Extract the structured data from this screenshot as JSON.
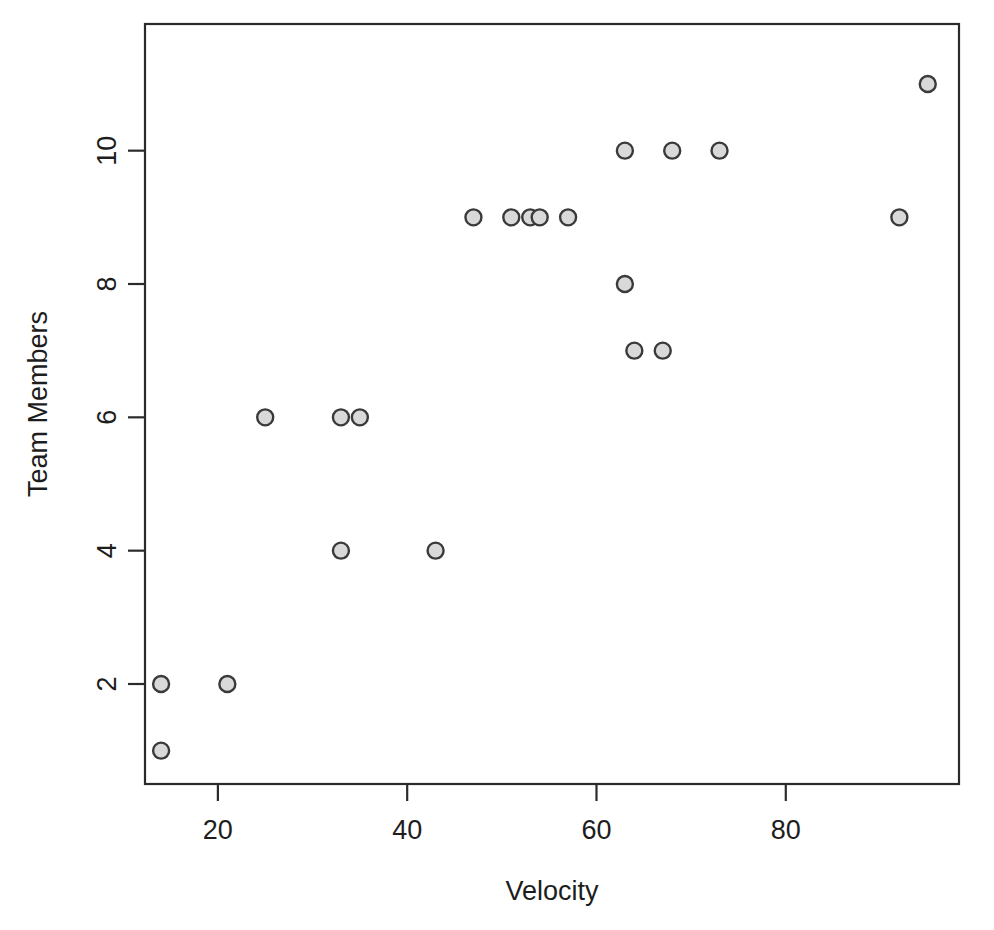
{
  "chart_data": {
    "type": "scatter",
    "title": "",
    "xlabel": "Velocity",
    "ylabel": "Team Members",
    "xlim": [
      12.3,
      98.3
    ],
    "ylim": [
      0.5,
      11.9
    ],
    "xticks": [
      20,
      40,
      60,
      80
    ],
    "xtick_labels": [
      "20",
      "40",
      "60",
      "80"
    ],
    "yticks": [
      2,
      4,
      6,
      8,
      10
    ],
    "ytick_labels": [
      "2",
      "4",
      "6",
      "8",
      "10"
    ],
    "grid": false,
    "legend": null,
    "point_style": {
      "marker": "circle",
      "fill": "#d9d9d9",
      "stroke": "#3a3a3a",
      "radius": 8
    },
    "series": [
      {
        "name": "Velocity vs Team Members",
        "points": [
          {
            "x": 14,
            "y": 1
          },
          {
            "x": 14,
            "y": 2
          },
          {
            "x": 21,
            "y": 2
          },
          {
            "x": 25,
            "y": 6
          },
          {
            "x": 33,
            "y": 4
          },
          {
            "x": 33,
            "y": 6
          },
          {
            "x": 35,
            "y": 6
          },
          {
            "x": 43,
            "y": 4
          },
          {
            "x": 47,
            "y": 9
          },
          {
            "x": 51,
            "y": 9
          },
          {
            "x": 53,
            "y": 9
          },
          {
            "x": 54,
            "y": 9
          },
          {
            "x": 57,
            "y": 9
          },
          {
            "x": 63,
            "y": 8
          },
          {
            "x": 63,
            "y": 10
          },
          {
            "x": 64,
            "y": 7
          },
          {
            "x": 67,
            "y": 7
          },
          {
            "x": 68,
            "y": 10
          },
          {
            "x": 73,
            "y": 10
          },
          {
            "x": 92,
            "y": 9
          },
          {
            "x": 95,
            "y": 11
          }
        ]
      }
    ]
  },
  "plot_box": {
    "left": 145,
    "right": 959,
    "top": 24,
    "bottom": 784
  },
  "axis_titles": {
    "x": "Velocity",
    "y": "Team Members"
  }
}
